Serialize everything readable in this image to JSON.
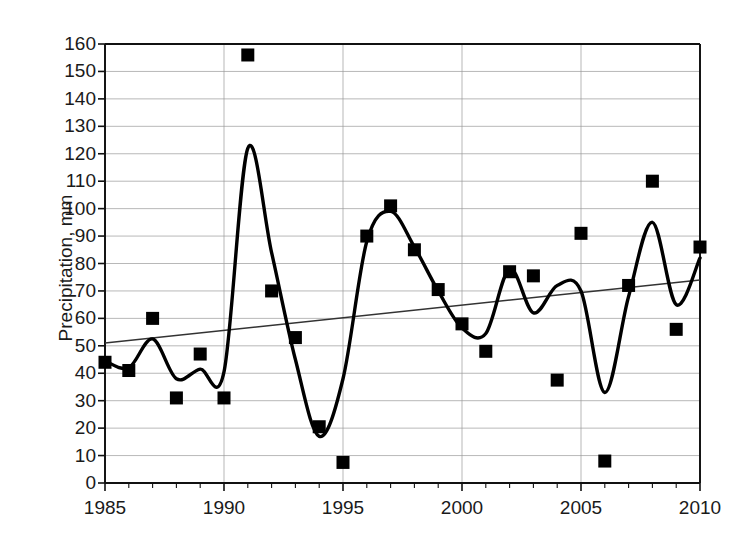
{
  "chart_data": {
    "type": "scatter",
    "title": "",
    "xlabel": "",
    "ylabel": "Precipitation, mm",
    "xlim": [
      1985,
      2010
    ],
    "ylim": [
      0,
      160
    ],
    "ytick_step": 10,
    "xtick_step": 5,
    "grid": true,
    "legend": "none",
    "x": [
      1985,
      1986,
      1987,
      1988,
      1989,
      1990,
      1991,
      1992,
      1993,
      1994,
      1995,
      1996,
      1997,
      1998,
      1999,
      2000,
      2001,
      2002,
      2003,
      2004,
      2005,
      2006,
      2007,
      2008,
      2009,
      2010
    ],
    "series": [
      {
        "name": "Precipitation",
        "marker": "filled-square",
        "color": "#000000",
        "values": [
          44,
          41,
          60,
          31,
          47,
          31,
          156,
          70,
          53,
          20.5,
          7.5,
          90,
          101,
          85,
          70.5,
          58,
          48,
          77,
          75.5,
          37.5,
          91,
          8,
          72,
          110,
          56,
          86
        ]
      },
      {
        "name": "Smoothed curve",
        "type": "line",
        "color": "#000000",
        "values": [
          44.5,
          42,
          52.5,
          38,
          41.5,
          40.5,
          122,
          84,
          45,
          17,
          38,
          88,
          99,
          86,
          70,
          56.5,
          54.5,
          78,
          62,
          72,
          70,
          33,
          68,
          95,
          65,
          82
        ]
      },
      {
        "name": "Linear trend",
        "type": "line",
        "color": "#333333",
        "endpoints": [
          [
            1985,
            51
          ],
          [
            2010,
            74
          ]
        ]
      }
    ],
    "ytick_labels": [
      "0",
      "10",
      "20",
      "30",
      "40",
      "50",
      "60",
      "70",
      "80",
      "90",
      "100",
      "110",
      "120",
      "130",
      "140",
      "150",
      "160"
    ],
    "xtick_labels": [
      "1985",
      "1990",
      "1995",
      "2000",
      "2005",
      "2010"
    ],
    "xticks": [
      1985,
      1990,
      1995,
      2000,
      2005,
      2010
    ],
    "yticks": [
      0,
      10,
      20,
      30,
      40,
      50,
      60,
      70,
      80,
      90,
      100,
      110,
      120,
      130,
      140,
      150,
      160
    ]
  }
}
